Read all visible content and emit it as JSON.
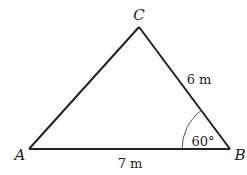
{
  "diagram": {
    "type": "triangle",
    "vertices": {
      "A": {
        "label": "A"
      },
      "B": {
        "label": "B"
      },
      "C": {
        "label": "C"
      }
    },
    "sides": {
      "AB": {
        "label": "7 m"
      },
      "BC": {
        "label": "6 m"
      }
    },
    "angles": {
      "B": {
        "label": "60°"
      }
    },
    "colors": {
      "stroke": "#222222",
      "arc": "#555555",
      "text": "#222222"
    }
  }
}
